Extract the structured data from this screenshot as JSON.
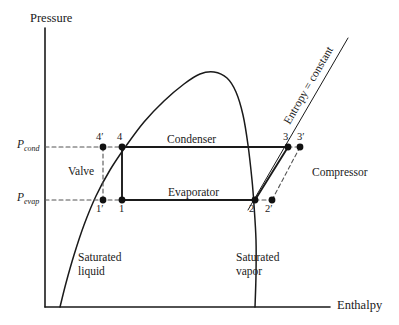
{
  "figure": {
    "type": "pressure-enthalpy-diagram"
  },
  "axes": {
    "y_title": "Pressure",
    "x_title": "Enthalpy",
    "pressure_levels": [
      {
        "id": "p-cond",
        "base": "P",
        "sub": "cond",
        "y": 147
      },
      {
        "id": "p-evap",
        "base": "P",
        "sub": "evap",
        "y": 200
      }
    ]
  },
  "components": {
    "condenser": "Condenser",
    "evaporator": "Evaporator",
    "valve": "Valve",
    "compressor": "Compressor"
  },
  "regions": {
    "saturated_liquid_line1": "Saturated",
    "saturated_liquid_line2": "liquid",
    "saturated_vapor_line1": "Saturated",
    "saturated_vapor_line2": "vapor"
  },
  "annotations": {
    "isentropic": "Entropy = constant"
  },
  "state_points": [
    {
      "label": "4′",
      "x": 103,
      "y": 147,
      "label_x": 96,
      "label_y": 131
    },
    {
      "label": "4",
      "x": 122,
      "y": 147,
      "label_x": 117,
      "label_y": 131
    },
    {
      "label": "1′",
      "x": 103,
      "y": 200,
      "label_x": 96,
      "label_y": 203
    },
    {
      "label": "1",
      "x": 122,
      "y": 200,
      "label_x": 119,
      "label_y": 203
    },
    {
      "label": "2",
      "x": 255,
      "y": 200,
      "label_x": 249,
      "label_y": 203
    },
    {
      "label": "2′",
      "x": 272,
      "y": 200,
      "label_x": 265,
      "label_y": 203
    },
    {
      "label": "3",
      "x": 288,
      "y": 147,
      "label_x": 283,
      "label_y": 131
    },
    {
      "label": "3′",
      "x": 300,
      "y": 147,
      "label_x": 297,
      "label_y": 131
    }
  ],
  "chart_data": {
    "type": "line",
    "title": "",
    "xlabel": "Enthalpy",
    "ylabel": "Pressure",
    "grid": false,
    "legend": null,
    "curves": [
      {
        "name": "saturation-dome",
        "comment": "Saturated liquid line rising from low enthalpy up to the critical point, then the saturated vapor line descending steeply.",
        "points": [
          [
            60,
            307
          ],
          [
            66,
            283
          ],
          [
            74,
            255
          ],
          [
            84,
            225
          ],
          [
            96,
            196
          ],
          [
            110,
            170
          ],
          [
            126,
            146
          ],
          [
            144,
            122
          ],
          [
            164,
            101
          ],
          [
            184,
            84
          ],
          [
            200,
            74
          ],
          [
            214,
            72
          ],
          [
            227,
            78
          ],
          [
            236,
            92
          ],
          [
            243,
            115
          ],
          [
            248,
            145
          ],
          [
            252,
            180
          ],
          [
            254,
            205
          ],
          [
            256,
            240
          ],
          [
            256,
            275
          ],
          [
            255,
            307
          ]
        ]
      },
      {
        "name": "condenser-line",
        "comment": "Constant pressure heat rejection at P_cond, state 4 to state 3.",
        "points": [
          [
            122,
            147
          ],
          [
            288,
            147
          ]
        ]
      },
      {
        "name": "evaporator-line",
        "comment": "Constant pressure heat absorption at P_evap, state 1 to state 2.",
        "points": [
          [
            122,
            200
          ],
          [
            255,
            200
          ]
        ]
      },
      {
        "name": "valve-line-actual",
        "comment": "Isenthalpic throttling, state 4 to state 1.",
        "points": [
          [
            122,
            147
          ],
          [
            122,
            200
          ]
        ]
      },
      {
        "name": "valve-line-ideal",
        "comment": "Throttling of subcooled liquid, state 4-prime to state 1-prime (dashed).",
        "points": [
          [
            103,
            147
          ],
          [
            103,
            200
          ]
        ],
        "style": "dashed"
      },
      {
        "name": "compressor-line-isentropic",
        "comment": "Ideal isentropic compression, state 2 to state 3.",
        "points": [
          [
            255,
            200
          ],
          [
            288,
            147
          ]
        ]
      },
      {
        "name": "compressor-line-actual",
        "comment": "Actual compression with superheated inlet, state 2-prime to state 3-prime (dashed).",
        "points": [
          [
            272,
            200
          ],
          [
            300,
            147
          ]
        ],
        "style": "dashed"
      },
      {
        "name": "entropy-constant-line",
        "comment": "Line of constant entropy passing through state 2 and state 3.",
        "points": [
          [
            248,
            210
          ],
          [
            348,
            38
          ]
        ]
      },
      {
        "name": "p-cond-dashed",
        "comment": "Dashed construction line from the pressure axis to state 4-prime.",
        "points": [
          [
            45,
            147
          ],
          [
            122,
            147
          ]
        ],
        "style": "dashed"
      },
      {
        "name": "p-evap-dashed",
        "comment": "Dashed construction line from the pressure axis to state 1-prime.",
        "points": [
          [
            45,
            200
          ],
          [
            122,
            200
          ]
        ],
        "style": "dashed"
      },
      {
        "name": "state2-to-2prime-dashed",
        "points": [
          [
            255,
            200
          ],
          [
            272,
            200
          ]
        ],
        "style": "dashed"
      },
      {
        "name": "state3-to-3prime-dashed",
        "points": [
          [
            288,
            147
          ],
          [
            300,
            147
          ]
        ],
        "style": "dashed"
      }
    ],
    "axis_lines": {
      "y_axis": [
        [
          45,
          28
        ],
        [
          45,
          307
        ]
      ],
      "x_axis": [
        [
          45,
          307
        ],
        [
          330,
          307
        ]
      ]
    }
  }
}
